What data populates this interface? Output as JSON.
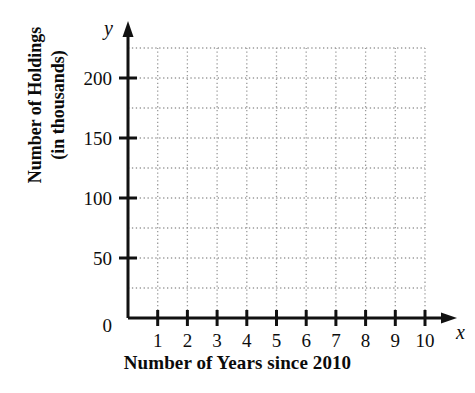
{
  "chart_data": {
    "type": "scatter",
    "title": "",
    "subtitle": "",
    "xlabel": "Number of Years since 2010",
    "ylabel_line1": "Number of Holdings",
    "ylabel_line2": "(in thousands)",
    "x_axis_variable": "x",
    "y_axis_variable": "y",
    "xlim": [
      0,
      10.5
    ],
    "ylim": [
      0,
      225
    ],
    "x_ticks": [
      1,
      2,
      3,
      4,
      5,
      6,
      7,
      8,
      9,
      10
    ],
    "x_tick_labels": [
      "1",
      "2",
      "3",
      "4",
      "5",
      "6",
      "7",
      "8",
      "9",
      "10"
    ],
    "y_ticks": [
      0,
      50,
      100,
      150,
      200
    ],
    "y_tick_labels": [
      "0",
      "50",
      "100",
      "150",
      "200"
    ],
    "x_gridlines": [
      1,
      2,
      3,
      4,
      5,
      6,
      7,
      8,
      9,
      10
    ],
    "y_gridlines": [
      25,
      50,
      75,
      100,
      125,
      150,
      175,
      200,
      225
    ],
    "grid": true,
    "grid_style": "dotted",
    "legend": false,
    "legend_position": "none",
    "series": [],
    "values": [],
    "annotations": [],
    "note": "Empty coordinate grid template with no plotted data points"
  },
  "colors": {
    "background": "#ffffff",
    "axis": "#111111",
    "grid": "#9a9a9a",
    "text": "#0d0d0d"
  }
}
